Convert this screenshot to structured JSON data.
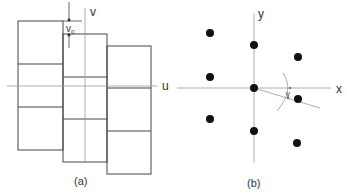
{
  "panel_a": {
    "caption": "(a)",
    "axis_u_label": "u",
    "axis_v_label": "v",
    "offset_label": "v",
    "offset_subscript": "0",
    "columns": [
      {
        "x": 18,
        "w": 45,
        "top": 21,
        "dividers": [
          64,
          107
        ],
        "bottom": 150
      },
      {
        "x": 63,
        "w": 44,
        "top": 34,
        "dividers": [
          77,
          119
        ],
        "bottom": 162
      },
      {
        "x": 107,
        "w": 44,
        "top": 46,
        "dividers": [
          88,
          131
        ],
        "bottom": 174
      }
    ]
  },
  "panel_b": {
    "caption": "(b)",
    "axis_x_label": "x",
    "axis_y_label": "y",
    "angle_label": "γ",
    "dots": [
      [
        210,
        33
      ],
      [
        254,
        45
      ],
      [
        298,
        57
      ],
      [
        210,
        77
      ],
      [
        254,
        88
      ],
      [
        298,
        99
      ],
      [
        210,
        119
      ],
      [
        254,
        131
      ],
      [
        297,
        143
      ]
    ]
  }
}
